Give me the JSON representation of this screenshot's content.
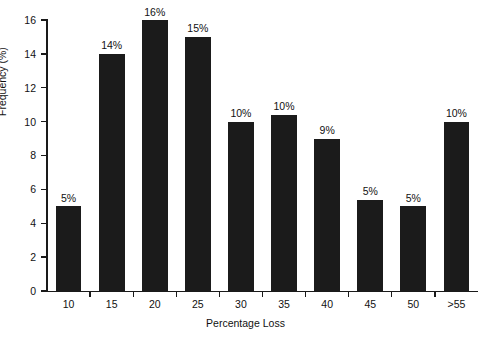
{
  "chart_data": {
    "type": "bar",
    "title": "",
    "xlabel": "Percentage Loss",
    "ylabel": "Frequency (%)",
    "categories": [
      "10",
      "15",
      "20",
      "25",
      "30",
      "35",
      "40",
      "45",
      "50",
      ">55"
    ],
    "values": [
      5,
      14,
      16,
      15,
      10,
      10.4,
      9,
      5.4,
      5,
      10
    ],
    "data_labels": [
      "5%",
      "14%",
      "16%",
      "15%",
      "10%",
      "10%",
      "9%",
      "5%",
      "5%",
      "10%"
    ],
    "ylim": [
      0,
      16
    ],
    "yticks": [
      0,
      2,
      4,
      6,
      8,
      10,
      12,
      14,
      16
    ],
    "ytick_labels": [
      "0",
      "2",
      "4",
      "6",
      "8",
      "10",
      "12",
      "14",
      "16"
    ],
    "grid": false,
    "legend": "none",
    "bar_color": "#1b1b1b",
    "background_color": "#ffffff",
    "axis_color": "#1a1a1a"
  }
}
